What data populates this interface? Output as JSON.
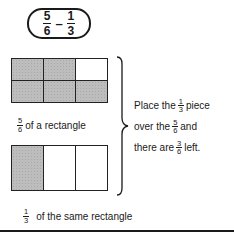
{
  "expression": {
    "left": {
      "numerator": "5",
      "denominator": "6"
    },
    "operator": "–",
    "right": {
      "numerator": "1",
      "denominator": "3"
    }
  },
  "top_figure": {
    "rows": 2,
    "cols": 3,
    "shaded": [
      true,
      true,
      false,
      true,
      true,
      true
    ],
    "caption": {
      "fraction": {
        "numerator": "5",
        "denominator": "6"
      },
      "text": "of a rectangle"
    }
  },
  "bottom_figure": {
    "rows": 1,
    "cols": 3,
    "shaded": [
      true,
      false,
      false
    ],
    "caption": {
      "fraction": {
        "numerator": "1",
        "denominator": "3"
      },
      "text": "of the same rectangle"
    }
  },
  "explanation": {
    "line1": {
      "before": "Place the",
      "fraction": {
        "numerator": "1",
        "denominator": "3"
      },
      "after": "piece"
    },
    "line2": {
      "before": "over the",
      "fraction": {
        "numerator": "5",
        "denominator": "6"
      },
      "after": "and"
    },
    "line3": {
      "before": "there are",
      "fraction": {
        "numerator": "3",
        "denominator": "6"
      },
      "after": "left."
    }
  },
  "colors": {
    "ink": "#1a1a1a",
    "shade": "#bdbdbd"
  }
}
